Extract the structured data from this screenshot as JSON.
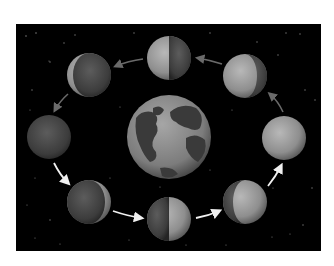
{
  "diagram": {
    "title": "Phases of the Moon around Earth",
    "background_color": "#000000",
    "frame": {
      "x": 16,
      "y": 24,
      "width": 305,
      "height": 227
    },
    "earth": {
      "name": "Earth",
      "cx": 169,
      "cy": 137,
      "r": 42
    },
    "moons": [
      {
        "id": "new-moon",
        "label": "New Moon",
        "cx": 49,
        "cy": 137,
        "r": 22,
        "lit": "none"
      },
      {
        "id": "waxing-crescent",
        "label": "Waxing Crescent",
        "cx": 89,
        "cy": 202,
        "r": 22,
        "lit": "right-crescent"
      },
      {
        "id": "first-quarter",
        "label": "First Quarter",
        "cx": 169,
        "cy": 219,
        "r": 22,
        "lit": "right-half"
      },
      {
        "id": "waxing-gibbous",
        "label": "Waxing Gibbous",
        "cx": 245,
        "cy": 202,
        "r": 22,
        "lit": "right-gibbous"
      },
      {
        "id": "full-moon",
        "label": "Full Moon",
        "cx": 284,
        "cy": 138,
        "r": 22,
        "lit": "full"
      },
      {
        "id": "waning-gibbous",
        "label": "Waning Gibbous",
        "cx": 245,
        "cy": 76,
        "r": 22,
        "lit": "left-gibbous"
      },
      {
        "id": "third-quarter",
        "label": "Third Quarter",
        "cx": 169,
        "cy": 58,
        "r": 22,
        "lit": "left-half"
      },
      {
        "id": "waning-crescent",
        "label": "Waning Crescent",
        "cx": 89,
        "cy": 75,
        "r": 22,
        "lit": "left-crescent"
      }
    ],
    "arrows": {
      "bright_color": "#f0f0f0",
      "dim_color": "#6a6a6a",
      "direction": "counter-clockwise"
    }
  }
}
